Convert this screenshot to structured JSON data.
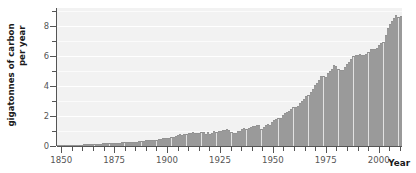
{
  "chart_data": {
    "type": "bar",
    "title": "",
    "xlabel": "Year",
    "ylabel_line1": "gigatonnes of carbon",
    "ylabel_line2": "per year",
    "ylabel": "gigatonnes of carbon per year",
    "xlim": [
      1848,
      2011
    ],
    "ylim": [
      0,
      9.2
    ],
    "grid": true,
    "legend": null,
    "y_ticks_major": [
      0,
      2,
      4,
      6,
      8
    ],
    "y_tick_labels": [
      "0",
      "2",
      "4",
      "6",
      "8"
    ],
    "y_ticks_minor": [
      1,
      3,
      5,
      7,
      9
    ],
    "x_ticks_major": [
      1850,
      1875,
      1900,
      1925,
      1950,
      1975,
      2000
    ],
    "x_tick_labels": [
      "1850",
      "1875",
      "1900",
      "1925",
      "1950",
      "1975",
      "2000"
    ],
    "x_ticks_minor": [
      1855,
      1860,
      1865,
      1870,
      1880,
      1885,
      1890,
      1895,
      1905,
      1910,
      1915,
      1920,
      1930,
      1935,
      1940,
      1945,
      1955,
      1960,
      1965,
      1970,
      1980,
      1985,
      1990,
      1995,
      2005,
      2010
    ],
    "bar_fill_color": "#e2e2e2",
    "bar_edge_color": "#8d8d8d",
    "plot_background_color": "#f2f2f2",
    "gridline_color": "#ffffff",
    "axis_color": "#555555",
    "x": [
      1850,
      1851,
      1852,
      1853,
      1854,
      1855,
      1856,
      1857,
      1858,
      1859,
      1860,
      1861,
      1862,
      1863,
      1864,
      1865,
      1866,
      1867,
      1868,
      1869,
      1870,
      1871,
      1872,
      1873,
      1874,
      1875,
      1876,
      1877,
      1878,
      1879,
      1880,
      1881,
      1882,
      1883,
      1884,
      1885,
      1886,
      1887,
      1888,
      1889,
      1890,
      1891,
      1892,
      1893,
      1894,
      1895,
      1896,
      1897,
      1898,
      1899,
      1900,
      1901,
      1902,
      1903,
      1904,
      1905,
      1906,
      1907,
      1908,
      1909,
      1910,
      1911,
      1912,
      1913,
      1914,
      1915,
      1916,
      1917,
      1918,
      1919,
      1920,
      1921,
      1922,
      1923,
      1924,
      1925,
      1926,
      1927,
      1928,
      1929,
      1930,
      1931,
      1932,
      1933,
      1934,
      1935,
      1936,
      1937,
      1938,
      1939,
      1940,
      1941,
      1942,
      1943,
      1944,
      1945,
      1946,
      1947,
      1948,
      1949,
      1950,
      1951,
      1952,
      1953,
      1954,
      1955,
      1956,
      1957,
      1958,
      1959,
      1960,
      1961,
      1962,
      1963,
      1964,
      1965,
      1966,
      1967,
      1968,
      1969,
      1970,
      1971,
      1972,
      1973,
      1974,
      1975,
      1976,
      1977,
      1978,
      1979,
      1980,
      1981,
      1982,
      1983,
      1984,
      1985,
      1986,
      1987,
      1988,
      1989,
      1990,
      1991,
      1992,
      1993,
      1994,
      1995,
      1996,
      1997,
      1998,
      1999,
      2000,
      2001,
      2002,
      2003,
      2004,
      2005,
      2006,
      2007,
      2008,
      2009,
      2010
    ],
    "values": [
      0.054,
      0.054,
      0.057,
      0.069,
      0.071,
      0.076,
      0.077,
      0.078,
      0.083,
      0.091,
      0.095,
      0.097,
      0.104,
      0.112,
      0.119,
      0.122,
      0.13,
      0.135,
      0.142,
      0.147,
      0.147,
      0.168,
      0.183,
      0.198,
      0.193,
      0.207,
      0.208,
      0.208,
      0.206,
      0.218,
      0.236,
      0.243,
      0.256,
      0.272,
      0.275,
      0.277,
      0.281,
      0.295,
      0.327,
      0.327,
      0.356,
      0.372,
      0.374,
      0.37,
      0.383,
      0.406,
      0.419,
      0.44,
      0.465,
      0.507,
      0.534,
      0.552,
      0.566,
      0.617,
      0.624,
      0.663,
      0.707,
      0.784,
      0.75,
      0.785,
      0.819,
      0.836,
      0.879,
      0.943,
      0.85,
      0.838,
      0.901,
      0.955,
      0.936,
      0.806,
      0.932,
      0.803,
      0.845,
      0.97,
      0.963,
      0.975,
      0.983,
      1.062,
      1.065,
      1.145,
      1.053,
      0.94,
      0.847,
      0.893,
      0.973,
      1.027,
      1.13,
      1.209,
      1.142,
      1.192,
      1.299,
      1.334,
      1.342,
      1.391,
      1.383,
      1.16,
      1.238,
      1.392,
      1.469,
      1.419,
      1.63,
      1.767,
      1.795,
      1.841,
      1.865,
      2.043,
      2.178,
      2.27,
      2.33,
      2.462,
      2.577,
      2.594,
      2.7,
      2.848,
      3.008,
      3.145,
      3.305,
      3.411,
      3.588,
      3.8,
      4.076,
      4.231,
      4.399,
      4.635,
      4.644,
      4.615,
      4.883,
      5.029,
      5.105,
      5.387,
      5.303,
      5.14,
      5.089,
      5.085,
      5.287,
      5.45,
      5.634,
      5.795,
      5.999,
      6.085,
      6.097,
      6.129,
      6.039,
      6.044,
      6.152,
      6.283,
      6.458,
      6.488,
      6.483,
      6.512,
      6.765,
      6.884,
      6.967,
      7.434,
      7.866,
      8.133,
      8.366,
      8.567,
      8.738,
      8.601,
      8.7
    ]
  }
}
